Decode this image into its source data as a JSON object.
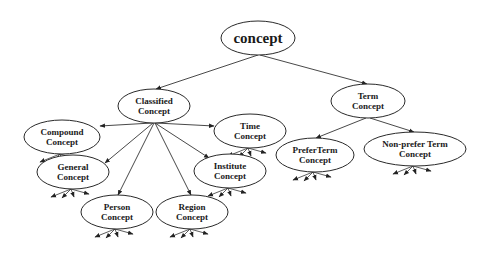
{
  "diagram": {
    "type": "tree",
    "nodes": [
      {
        "id": "concept",
        "lines": [
          "concept"
        ],
        "cx": 258,
        "cy": 38,
        "rx": 37,
        "ry": 17,
        "font": 15
      },
      {
        "id": "classified",
        "lines": [
          "Classified",
          "Concept"
        ],
        "cx": 154,
        "cy": 106,
        "rx": 36,
        "ry": 17,
        "font": 9
      },
      {
        "id": "term",
        "lines": [
          "Term",
          "Concept"
        ],
        "cx": 368,
        "cy": 101,
        "rx": 37,
        "ry": 17,
        "font": 9
      },
      {
        "id": "compound",
        "lines": [
          "Compound",
          "Concept"
        ],
        "cx": 62,
        "cy": 137,
        "rx": 38,
        "ry": 17,
        "font": 9
      },
      {
        "id": "time",
        "lines": [
          "Time",
          "Concept"
        ],
        "cx": 250,
        "cy": 131,
        "rx": 36,
        "ry": 17,
        "font": 9
      },
      {
        "id": "general",
        "lines": [
          "General",
          "Concept"
        ],
        "cx": 73,
        "cy": 172,
        "rx": 36,
        "ry": 17,
        "font": 9
      },
      {
        "id": "institute",
        "lines": [
          "Institute",
          "Concept"
        ],
        "cx": 230,
        "cy": 171,
        "rx": 36,
        "ry": 17,
        "font": 9
      },
      {
        "id": "person",
        "lines": [
          "Person",
          "Concept"
        ],
        "cx": 117,
        "cy": 212,
        "rx": 36,
        "ry": 17,
        "font": 9
      },
      {
        "id": "region",
        "lines": [
          "Region",
          "Concept"
        ],
        "cx": 192,
        "cy": 212,
        "rx": 36,
        "ry": 17,
        "font": 9
      },
      {
        "id": "preferterm",
        "lines": [
          "PreferTerm",
          "Concept"
        ],
        "cx": 315,
        "cy": 155,
        "rx": 39,
        "ry": 17,
        "font": 9
      },
      {
        "id": "nonprefer",
        "lines": [
          "Non-prefer Term",
          "Concept"
        ],
        "cx": 415,
        "cy": 149,
        "rx": 51,
        "ry": 17,
        "font": 9
      }
    ],
    "edges": [
      {
        "from": "concept",
        "to": "classified",
        "x1": 258,
        "y1": 55,
        "x2": 156,
        "y2": 89
      },
      {
        "from": "concept",
        "to": "term",
        "x1": 260,
        "y1": 55,
        "x2": 367,
        "y2": 84
      },
      {
        "from": "classified",
        "to": "compound",
        "x1": 152,
        "y1": 123,
        "x2": 100,
        "y2": 126
      },
      {
        "from": "classified",
        "to": "time",
        "x1": 156,
        "y1": 123,
        "x2": 214,
        "y2": 126
      },
      {
        "from": "classified",
        "to": "general",
        "x1": 153,
        "y1": 123,
        "x2": 105,
        "y2": 163
      },
      {
        "from": "classified",
        "to": "institute",
        "x1": 155,
        "y1": 123,
        "x2": 209,
        "y2": 158
      },
      {
        "from": "classified",
        "to": "person",
        "x1": 154,
        "y1": 123,
        "x2": 118,
        "y2": 195
      },
      {
        "from": "classified",
        "to": "region",
        "x1": 155,
        "y1": 123,
        "x2": 191,
        "y2": 195
      },
      {
        "from": "term",
        "to": "preferterm",
        "x1": 366,
        "y1": 118,
        "x2": 316,
        "y2": 138
      },
      {
        "from": "term",
        "to": "nonprefer",
        "x1": 370,
        "y1": 118,
        "x2": 414,
        "y2": 132
      }
    ]
  }
}
